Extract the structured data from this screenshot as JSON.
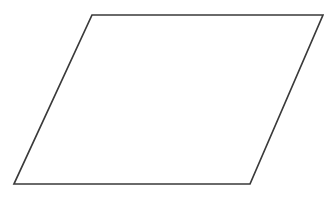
{
  "figure": {
    "title": "Parallelogram",
    "background_color": "#ffffff",
    "stroke_color": "#3a3a3a",
    "fill_color": "#ffffff",
    "stroke_width": 1.7,
    "canvas": {
      "width": 324,
      "height": 198
    },
    "shape": {
      "name": "parallelogram",
      "sides": 4,
      "vertices": [
        {
          "name": "top-left",
          "x": 92,
          "y": 15
        },
        {
          "name": "top-right",
          "x": 323,
          "y": 15
        },
        {
          "name": "bottom-right",
          "x": 250,
          "y": 184
        },
        {
          "name": "bottom-left",
          "x": 14,
          "y": 184
        }
      ],
      "points_attr": "92,15 323,15 250,184 14,184"
    }
  }
}
